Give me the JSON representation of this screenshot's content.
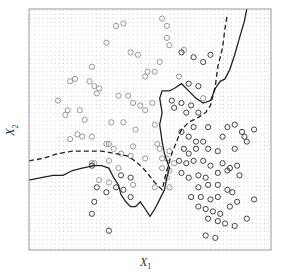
{
  "chart_data": {
    "type": "scatter",
    "title": "",
    "xlabel": "X1",
    "ylabel": "X2",
    "xlabel_main": "X",
    "xlabel_sub": "1",
    "ylabel_main": "X",
    "ylabel_sub": "2",
    "xlim": [
      0,
      1
    ],
    "ylim": [
      0,
      1
    ],
    "grid": "dotted background grid of predicted class",
    "legend": null,
    "series": [
      {
        "name": "class-light",
        "color": "#9a9a9a",
        "marker": "circle",
        "points": [
          [
            0.36,
            0.93
          ],
          [
            0.39,
            0.94
          ],
          [
            0.55,
            0.96
          ],
          [
            0.57,
            0.93
          ],
          [
            0.32,
            0.86
          ],
          [
            0.42,
            0.82
          ],
          [
            0.45,
            0.81
          ],
          [
            0.57,
            0.88
          ],
          [
            0.58,
            0.85
          ],
          [
            0.54,
            0.78
          ],
          [
            0.26,
            0.76
          ],
          [
            0.17,
            0.7
          ],
          [
            0.19,
            0.71
          ],
          [
            0.25,
            0.7
          ],
          [
            0.29,
            0.67
          ],
          [
            0.27,
            0.68
          ],
          [
            0.48,
            0.72
          ],
          [
            0.52,
            0.74
          ],
          [
            0.49,
            0.74
          ],
          [
            0.12,
            0.62
          ],
          [
            0.28,
            0.65
          ],
          [
            0.37,
            0.64
          ],
          [
            0.41,
            0.64
          ],
          [
            0.43,
            0.61
          ],
          [
            0.46,
            0.6
          ],
          [
            0.48,
            0.58
          ],
          [
            0.51,
            0.61
          ],
          [
            0.16,
            0.58
          ],
          [
            0.21,
            0.58
          ],
          [
            0.15,
            0.56
          ],
          [
            0.23,
            0.54
          ],
          [
            0.34,
            0.53
          ],
          [
            0.39,
            0.53
          ],
          [
            0.44,
            0.5
          ],
          [
            0.52,
            0.52
          ],
          [
            0.2,
            0.48
          ],
          [
            0.22,
            0.47
          ],
          [
            0.17,
            0.46
          ],
          [
            0.26,
            0.47
          ],
          [
            0.32,
            0.44
          ],
          [
            0.33,
            0.44
          ],
          [
            0.35,
            0.42
          ],
          [
            0.43,
            0.43
          ],
          [
            0.53,
            0.44
          ],
          [
            0.54,
            0.42
          ],
          [
            0.58,
            0.41
          ],
          [
            0.38,
            0.4
          ],
          [
            0.42,
            0.39
          ],
          [
            0.48,
            0.38
          ],
          [
            0.55,
            0.38
          ],
          [
            0.57,
            0.38
          ],
          [
            0.33,
            0.37
          ],
          [
            0.55,
            0.34
          ],
          [
            0.6,
            0.36
          ],
          [
            0.58,
            0.33
          ],
          [
            0.57,
            0.3
          ],
          [
            0.26,
            0.36
          ],
          [
            0.27,
            0.36
          ],
          [
            0.37,
            0.34
          ],
          [
            0.29,
            0.29
          ],
          [
            0.33,
            0.28
          ],
          [
            0.43,
            0.27
          ],
          [
            0.52,
            0.26
          ],
          [
            0.58,
            0.26
          ],
          [
            0.64,
            0.83
          ],
          [
            0.72,
            0.63
          ],
          [
            0.62,
            0.72
          ]
        ]
      },
      {
        "name": "class-dark",
        "color": "#444444",
        "marker": "circle",
        "points": [
          [
            0.59,
            0.62
          ],
          [
            0.6,
            0.59
          ],
          [
            0.63,
            0.61
          ],
          [
            0.66,
            0.69
          ],
          [
            0.7,
            0.68
          ],
          [
            0.67,
            0.6
          ],
          [
            0.65,
            0.57
          ],
          [
            0.7,
            0.57
          ],
          [
            0.68,
            0.51
          ],
          [
            0.74,
            0.51
          ],
          [
            0.82,
            0.51
          ],
          [
            0.85,
            0.52
          ],
          [
            0.88,
            0.49
          ],
          [
            0.63,
            0.49
          ],
          [
            0.66,
            0.47
          ],
          [
            0.69,
            0.45
          ],
          [
            0.72,
            0.45
          ],
          [
            0.8,
            0.47
          ],
          [
            0.85,
            0.42
          ],
          [
            0.89,
            0.47
          ],
          [
            0.9,
            0.45
          ],
          [
            0.93,
            0.5
          ],
          [
            0.64,
            0.42
          ],
          [
            0.66,
            0.4
          ],
          [
            0.69,
            0.42
          ],
          [
            0.74,
            0.42
          ],
          [
            0.78,
            0.41
          ],
          [
            0.62,
            0.37
          ],
          [
            0.65,
            0.36
          ],
          [
            0.68,
            0.37
          ],
          [
            0.72,
            0.37
          ],
          [
            0.75,
            0.35
          ],
          [
            0.8,
            0.36
          ],
          [
            0.83,
            0.34
          ],
          [
            0.86,
            0.35
          ],
          [
            0.63,
            0.32
          ],
          [
            0.66,
            0.3
          ],
          [
            0.7,
            0.31
          ],
          [
            0.73,
            0.3
          ],
          [
            0.78,
            0.32
          ],
          [
            0.82,
            0.33
          ],
          [
            0.87,
            0.31
          ],
          [
            0.7,
            0.26
          ],
          [
            0.74,
            0.27
          ],
          [
            0.78,
            0.27
          ],
          [
            0.82,
            0.25
          ],
          [
            0.93,
            0.21
          ],
          [
            0.67,
            0.22
          ],
          [
            0.71,
            0.22
          ],
          [
            0.75,
            0.21
          ],
          [
            0.78,
            0.22
          ],
          [
            0.84,
            0.24
          ],
          [
            0.7,
            0.18
          ],
          [
            0.73,
            0.17
          ],
          [
            0.76,
            0.16
          ],
          [
            0.79,
            0.15
          ],
          [
            0.83,
            0.18
          ],
          [
            0.86,
            0.2
          ],
          [
            0.74,
            0.13
          ],
          [
            0.78,
            0.12
          ],
          [
            0.81,
            0.11
          ],
          [
            0.85,
            0.1
          ],
          [
            0.9,
            0.13
          ],
          [
            0.73,
            0.06
          ],
          [
            0.77,
            0.05
          ],
          [
            0.26,
            0.35
          ],
          [
            0.28,
            0.26
          ],
          [
            0.32,
            0.24
          ],
          [
            0.27,
            0.2
          ],
          [
            0.26,
            0.15
          ],
          [
            0.36,
            0.26
          ],
          [
            0.38,
            0.31
          ],
          [
            0.39,
            0.25
          ],
          [
            0.42,
            0.22
          ],
          [
            0.42,
            0.3
          ],
          [
            0.33,
            0.08
          ],
          [
            0.63,
            0.82
          ],
          [
            0.68,
            0.8
          ],
          [
            0.72,
            0.78
          ],
          [
            0.75,
            0.81
          ]
        ]
      }
    ],
    "boundaries": [
      {
        "name": "KNN decision boundary",
        "style": "solid",
        "color": "#222222",
        "points": [
          [
            0.0,
            0.29
          ],
          [
            0.05,
            0.3
          ],
          [
            0.1,
            0.31
          ],
          [
            0.14,
            0.31
          ],
          [
            0.18,
            0.33
          ],
          [
            0.22,
            0.34
          ],
          [
            0.27,
            0.35
          ],
          [
            0.3,
            0.35
          ],
          [
            0.33,
            0.34
          ],
          [
            0.35,
            0.3
          ],
          [
            0.37,
            0.27
          ],
          [
            0.38,
            0.23
          ],
          [
            0.4,
            0.2
          ],
          [
            0.42,
            0.18
          ],
          [
            0.44,
            0.18
          ],
          [
            0.46,
            0.2
          ],
          [
            0.48,
            0.17
          ],
          [
            0.5,
            0.14
          ],
          [
            0.52,
            0.17
          ],
          [
            0.54,
            0.21
          ],
          [
            0.56,
            0.25
          ],
          [
            0.57,
            0.3
          ],
          [
            0.58,
            0.34
          ],
          [
            0.57,
            0.37
          ],
          [
            0.56,
            0.4
          ],
          [
            0.55,
            0.45
          ],
          [
            0.54,
            0.52
          ],
          [
            0.55,
            0.57
          ],
          [
            0.54,
            0.63
          ],
          [
            0.55,
            0.66
          ],
          [
            0.58,
            0.66
          ],
          [
            0.6,
            0.67
          ],
          [
            0.63,
            0.69
          ],
          [
            0.66,
            0.66
          ],
          [
            0.69,
            0.63
          ],
          [
            0.72,
            0.61
          ],
          [
            0.75,
            0.62
          ],
          [
            0.77,
            0.67
          ],
          [
            0.79,
            0.7
          ],
          [
            0.81,
            0.71
          ],
          [
            0.83,
            0.75
          ],
          [
            0.85,
            0.81
          ],
          [
            0.87,
            0.88
          ],
          [
            0.89,
            0.95
          ],
          [
            0.9,
            1.0
          ]
        ]
      },
      {
        "name": "Bayes decision boundary",
        "style": "dashed",
        "color": "#222222",
        "points": [
          [
            0.0,
            0.37
          ],
          [
            0.06,
            0.38
          ],
          [
            0.12,
            0.4
          ],
          [
            0.18,
            0.41
          ],
          [
            0.24,
            0.41
          ],
          [
            0.3,
            0.41
          ],
          [
            0.36,
            0.4
          ],
          [
            0.41,
            0.39
          ],
          [
            0.45,
            0.36
          ],
          [
            0.48,
            0.33
          ],
          [
            0.52,
            0.28
          ],
          [
            0.55,
            0.25
          ],
          [
            0.57,
            0.33
          ],
          [
            0.59,
            0.4
          ],
          [
            0.61,
            0.45
          ],
          [
            0.63,
            0.5
          ],
          [
            0.66,
            0.53
          ],
          [
            0.7,
            0.55
          ],
          [
            0.73,
            0.57
          ],
          [
            0.75,
            0.6
          ],
          [
            0.77,
            0.68
          ],
          [
            0.78,
            0.76
          ],
          [
            0.8,
            0.84
          ],
          [
            0.81,
            0.92
          ],
          [
            0.82,
            0.98
          ]
        ]
      }
    ]
  }
}
